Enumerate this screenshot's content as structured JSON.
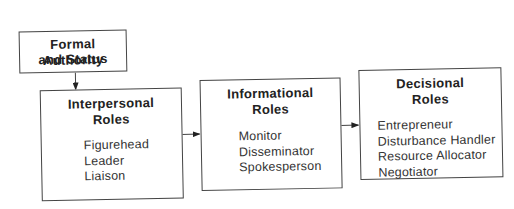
{
  "diagram": {
    "source": {
      "title_line1": "Formal Authority",
      "title_line2": "and Status"
    },
    "boxes": [
      {
        "title_line1": "Interpersonal",
        "title_line2": "Roles",
        "items": [
          "Figurehead",
          "Leader",
          "Liaison"
        ]
      },
      {
        "title_line1": "Informational",
        "title_line2": "Roles",
        "items": [
          "Monitor",
          "Disseminator",
          "Spokesperson"
        ]
      },
      {
        "title_line1": "Decisional",
        "title_line2": "Roles",
        "items": [
          "Entrepreneur",
          "Disturbance Handler",
          "Resource Allocator",
          "Negotiator"
        ]
      }
    ],
    "edges": [
      {
        "from": "Formal Authority and Status",
        "to": "Interpersonal Roles"
      },
      {
        "from": "Interpersonal Roles",
        "to": "Informational Roles"
      },
      {
        "from": "Informational Roles",
        "to": "Decisional Roles"
      }
    ],
    "colors": {
      "stroke": "#444444",
      "text": "#2a2a2a",
      "background": "#ffffff"
    }
  }
}
